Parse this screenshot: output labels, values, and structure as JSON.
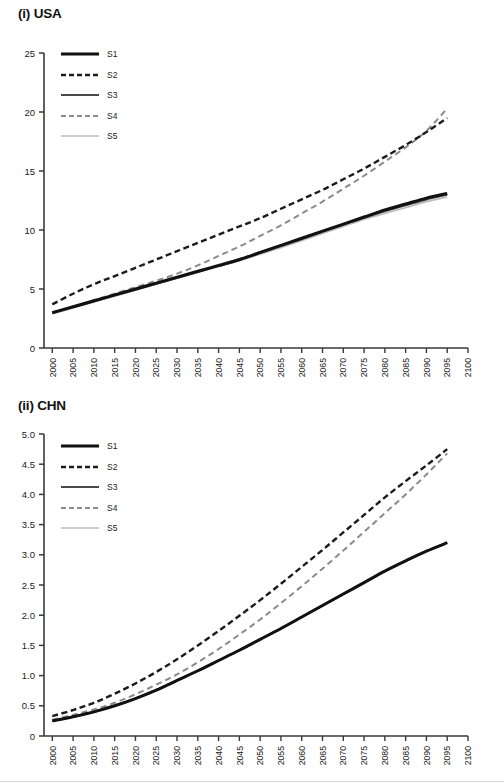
{
  "figure": {
    "panels": [
      {
        "id": "usa",
        "title": "(i) USA",
        "legend": [
          {
            "label": "S1",
            "style": "solid",
            "color": "#111111",
            "width": 3.0
          },
          {
            "label": "S2",
            "style": "dashed",
            "color": "#1b1b1b",
            "width": 2.4
          },
          {
            "label": "S3",
            "style": "solid",
            "color": "#4a4a4a",
            "width": 2.2
          },
          {
            "label": "S4",
            "style": "dashed",
            "color": "#8a8a8a",
            "width": 2.0
          },
          {
            "label": "S5",
            "style": "solid",
            "color": "#bdbdbd",
            "width": 1.7
          }
        ],
        "yticks": [
          "0",
          "5",
          "10",
          "15",
          "20",
          "25"
        ],
        "xticks": [
          "2000",
          "2005",
          "2010",
          "2015",
          "2020",
          "2025",
          "2030",
          "2035",
          "2040",
          "2045",
          "2050",
          "2055",
          "2060",
          "2065",
          "2070",
          "2075",
          "2080",
          "2085",
          "2090",
          "2095",
          "2100"
        ]
      },
      {
        "id": "chn",
        "title": "(ii) CHN",
        "legend": [
          {
            "label": "S1",
            "style": "solid",
            "color": "#111111",
            "width": 3.0
          },
          {
            "label": "S2",
            "style": "dashed",
            "color": "#1b1b1b",
            "width": 2.4
          },
          {
            "label": "S3",
            "style": "solid",
            "color": "#4a4a4a",
            "width": 2.2
          },
          {
            "label": "S4",
            "style": "dashed",
            "color": "#8a8a8a",
            "width": 2.0
          },
          {
            "label": "S5",
            "style": "solid",
            "color": "#bdbdbd",
            "width": 1.7
          }
        ],
        "yticks": [
          "0",
          "0.5",
          "1.0",
          "1.5",
          "2.0",
          "2.5",
          "3.0",
          "3.5",
          "4.0",
          "4.5",
          "5.0"
        ],
        "xticks": [
          "2000",
          "2005",
          "2010",
          "2015",
          "2020",
          "2025",
          "2030",
          "2035",
          "2040",
          "2045",
          "2050",
          "2055",
          "2060",
          "2065",
          "2070",
          "2075",
          "2080",
          "2085",
          "2090",
          "2095",
          "2100"
        ]
      }
    ]
  },
  "chart_data": [
    {
      "type": "line",
      "title": "(i) USA",
      "xlabel": "",
      "ylabel": "",
      "xlim": [
        1998,
        2100
      ],
      "ylim": [
        0,
        25
      ],
      "ytick_values": [
        0,
        5,
        10,
        15,
        20,
        25
      ],
      "grid": false,
      "legend_position": "top-left-inside",
      "x": [
        2000,
        2005,
        2010,
        2015,
        2020,
        2025,
        2030,
        2035,
        2040,
        2045,
        2050,
        2055,
        2060,
        2065,
        2070,
        2075,
        2080,
        2085,
        2090,
        2095
      ],
      "series": [
        {
          "name": "S1",
          "style": "solid",
          "color": "#111111",
          "values": [
            3.0,
            3.5,
            4.0,
            4.5,
            5.0,
            5.5,
            6.0,
            6.5,
            7.0,
            7.5,
            8.1,
            8.7,
            9.3,
            9.9,
            10.5,
            11.1,
            11.7,
            12.2,
            12.7,
            13.1
          ]
        },
        {
          "name": "S2",
          "style": "dashed",
          "color": "#1b1b1b",
          "values": [
            3.7,
            4.6,
            5.4,
            6.1,
            6.8,
            7.5,
            8.2,
            8.9,
            9.6,
            10.3,
            11.0,
            11.8,
            12.6,
            13.4,
            14.3,
            15.2,
            16.2,
            17.2,
            18.3,
            19.5
          ]
        },
        {
          "name": "S3",
          "style": "solid",
          "color": "#4a4a4a",
          "values": [
            2.95,
            3.45,
            3.95,
            4.45,
            4.95,
            5.45,
            5.95,
            6.45,
            6.95,
            7.45,
            8.05,
            8.65,
            9.25,
            9.85,
            10.45,
            11.05,
            11.6,
            12.1,
            12.6,
            13.0
          ]
        },
        {
          "name": "S4",
          "style": "dashed",
          "color": "#8a8a8a",
          "values": [
            3.0,
            3.5,
            4.05,
            4.6,
            5.15,
            5.7,
            6.3,
            7.0,
            7.8,
            8.6,
            9.5,
            10.4,
            11.4,
            12.4,
            13.5,
            14.6,
            15.8,
            17.0,
            18.4,
            20.3
          ]
        },
        {
          "name": "S5",
          "style": "solid",
          "color": "#bdbdbd",
          "values": [
            2.9,
            3.4,
            3.9,
            4.4,
            4.9,
            5.4,
            5.9,
            6.4,
            6.9,
            7.4,
            7.95,
            8.5,
            9.1,
            9.7,
            10.3,
            10.9,
            11.4,
            11.9,
            12.4,
            12.8
          ]
        }
      ]
    },
    {
      "type": "line",
      "title": "(ii) CHN",
      "xlabel": "",
      "ylabel": "",
      "xlim": [
        1998,
        2100
      ],
      "ylim": [
        0,
        5.0
      ],
      "ytick_values": [
        0,
        0.5,
        1.0,
        1.5,
        2.0,
        2.5,
        3.0,
        3.5,
        4.0,
        4.5,
        5.0
      ],
      "grid": false,
      "legend_position": "top-left-inside",
      "x": [
        2000,
        2005,
        2010,
        2015,
        2020,
        2025,
        2030,
        2035,
        2040,
        2045,
        2050,
        2055,
        2060,
        2065,
        2070,
        2075,
        2080,
        2085,
        2090,
        2095
      ],
      "series": [
        {
          "name": "S1",
          "style": "solid",
          "color": "#111111",
          "values": [
            0.25,
            0.32,
            0.4,
            0.5,
            0.62,
            0.76,
            0.92,
            1.08,
            1.25,
            1.42,
            1.6,
            1.78,
            1.97,
            2.16,
            2.35,
            2.54,
            2.73,
            2.9,
            3.06,
            3.2
          ]
        },
        {
          "name": "S2",
          "style": "dashed",
          "color": "#1b1b1b",
          "values": [
            0.33,
            0.43,
            0.55,
            0.7,
            0.87,
            1.06,
            1.27,
            1.5,
            1.74,
            1.99,
            2.25,
            2.52,
            2.8,
            3.08,
            3.37,
            3.66,
            3.95,
            4.22,
            4.48,
            4.75
          ]
        },
        {
          "name": "S3",
          "style": "solid",
          "color": "#4a4a4a",
          "values": [
            0.25,
            0.32,
            0.4,
            0.5,
            0.62,
            0.76,
            0.92,
            1.08,
            1.25,
            1.42,
            1.6,
            1.78,
            1.97,
            2.16,
            2.35,
            2.54,
            2.73,
            2.9,
            3.06,
            3.2
          ]
        },
        {
          "name": "S4",
          "style": "dashed",
          "color": "#8a8a8a",
          "values": [
            0.27,
            0.35,
            0.44,
            0.55,
            0.69,
            0.85,
            1.02,
            1.22,
            1.44,
            1.68,
            1.93,
            2.2,
            2.48,
            2.77,
            3.07,
            3.38,
            3.69,
            4.0,
            4.33,
            4.68
          ]
        },
        {
          "name": "S5",
          "style": "solid",
          "color": "#bdbdbd",
          "values": [
            0.25,
            0.32,
            0.4,
            0.5,
            0.62,
            0.76,
            0.92,
            1.08,
            1.25,
            1.42,
            1.6,
            1.78,
            1.97,
            2.16,
            2.35,
            2.54,
            2.73,
            2.9,
            3.06,
            3.2
          ]
        }
      ]
    }
  ]
}
